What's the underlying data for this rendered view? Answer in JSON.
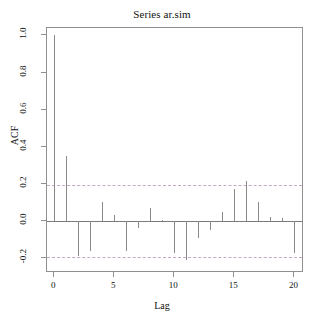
{
  "chart_data": {
    "type": "bar",
    "title": "Series  ar.sim",
    "xlabel": "Lag",
    "ylabel": "ACF",
    "grid": false,
    "legend": null,
    "xlim": [
      -0.6,
      20.8
    ],
    "ylim": [
      -0.28,
      1.04
    ],
    "xticks": [
      0,
      5,
      10,
      15,
      20
    ],
    "xtick_labels": [
      "0",
      "5",
      "10",
      "15",
      "20"
    ],
    "yticks": [
      1.0,
      0.8,
      0.6,
      0.4,
      0.2,
      0.0,
      -0.2
    ],
    "ytick_labels": [
      "1.0",
      "0.8",
      "0.6",
      "0.4",
      "0.2",
      "0.0",
      "-0.2"
    ],
    "confidence_bands": [
      0.195,
      -0.195
    ],
    "categories": [
      0,
      1,
      2,
      3,
      4,
      5,
      6,
      7,
      8,
      9,
      10,
      11,
      12,
      13,
      14,
      15,
      16,
      17,
      18,
      19,
      20
    ],
    "values": [
      1.0,
      0.35,
      -0.19,
      -0.16,
      0.1,
      0.03,
      -0.16,
      -0.04,
      0.07,
      0.005,
      -0.17,
      -0.21,
      -0.09,
      -0.05,
      0.05,
      0.17,
      0.215,
      0.1,
      0.02,
      0.018,
      -0.17
    ]
  }
}
